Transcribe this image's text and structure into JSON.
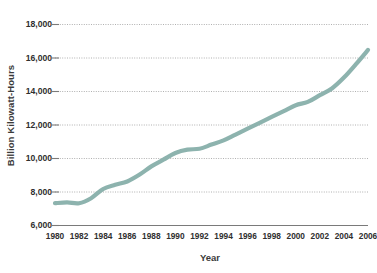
{
  "chart_data": {
    "type": "line",
    "title": "",
    "xlabel": "Year",
    "ylabel": "Billion Kilowatt-Hours",
    "xlim": [
      1980,
      2006
    ],
    "ylim": [
      6000,
      18000
    ],
    "grid": true,
    "legend": "none",
    "y_ticks": [
      6000,
      8000,
      10000,
      12000,
      14000,
      16000,
      18000
    ],
    "y_tick_labels": [
      "6,000",
      "8,000",
      "10,000",
      "12,000",
      "14,000",
      "16,000",
      "18,000"
    ],
    "x_ticks": [
      1980,
      1982,
      1984,
      1986,
      1988,
      1990,
      1992,
      1994,
      1996,
      1998,
      2000,
      2002,
      2004,
      2006
    ],
    "x_tick_labels": [
      "1980",
      "1982",
      "1984",
      "1986",
      "1988",
      "1990",
      "1992",
      "1994",
      "1996",
      "1998",
      "2000",
      "2002",
      "2004",
      "2006"
    ],
    "series": [
      {
        "name": "Electricity Consumption",
        "color": "#8db3ae",
        "x": [
          1980,
          1981,
          1982,
          1983,
          1984,
          1985,
          1986,
          1987,
          1988,
          1989,
          1990,
          1991,
          1992,
          1993,
          1994,
          1995,
          1996,
          1997,
          1998,
          1999,
          2000,
          2001,
          2002,
          2003,
          2004,
          2005,
          2006
        ],
        "values": [
          7300,
          7350,
          7300,
          7600,
          8150,
          8400,
          8600,
          9000,
          9500,
          9900,
          10300,
          10500,
          10550,
          10800,
          11050,
          11400,
          11750,
          12100,
          12450,
          12800,
          13150,
          13350,
          13750,
          14150,
          14800,
          15600,
          16450
        ]
      }
    ]
  },
  "axes": {
    "y_title": "Billion Kilowatt-Hours",
    "x_title": "Year"
  },
  "style": {
    "line_color": "#8db3ae",
    "grid_color": "#b0b0b0",
    "baseline_color": "#7a7a7a",
    "text_color": "#2f2f2f",
    "background": "#ffffff"
  }
}
